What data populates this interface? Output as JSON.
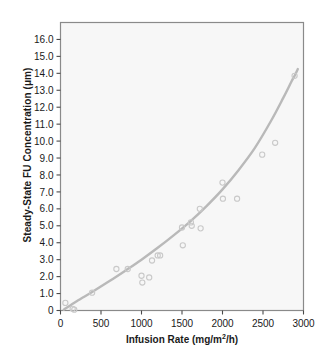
{
  "chart_data": {
    "type": "scatter",
    "title": "",
    "xlabel": "Infusion Rate (mg/m2/h)",
    "xlabel_parts": {
      "text_before": "Infusion Rate (mg/m",
      "superscript": "2",
      "text_after": "/h)"
    },
    "ylabel": "Steady-State FU Concentration (μm)",
    "xlim": [
      0,
      3000
    ],
    "ylim": [
      0,
      17
    ],
    "xticks": [
      0,
      500,
      1000,
      1500,
      2000,
      2500,
      3000
    ],
    "xtick_labels": [
      "0",
      "500",
      "1000",
      "1500",
      "2000",
      "2500",
      "3000"
    ],
    "yticks": [
      0,
      1,
      2,
      3,
      4,
      5,
      6,
      7,
      8,
      9,
      10,
      11,
      12,
      13,
      14,
      15,
      16
    ],
    "ytick_labels": [
      "0",
      "1.0",
      "2.0",
      "3.0",
      "4.0",
      "5.0",
      "6.0",
      "7.0",
      "8.0",
      "9.0",
      "10.0",
      "11.0",
      "12.0",
      "13.0",
      "14.0",
      "15.0",
      "16.0"
    ],
    "grid": false,
    "legend": null,
    "marker": "open-circle",
    "points": [
      {
        "x": 60,
        "y": 0.45
      },
      {
        "x": 150,
        "y": 0.1
      },
      {
        "x": 170,
        "y": 0.05
      },
      {
        "x": 390,
        "y": 1.05
      },
      {
        "x": 690,
        "y": 2.45
      },
      {
        "x": 830,
        "y": 2.45
      },
      {
        "x": 1000,
        "y": 2.05
      },
      {
        "x": 1010,
        "y": 1.65
      },
      {
        "x": 1095,
        "y": 1.95
      },
      {
        "x": 1130,
        "y": 2.95
      },
      {
        "x": 1200,
        "y": 3.25
      },
      {
        "x": 1230,
        "y": 3.25
      },
      {
        "x": 1500,
        "y": 4.9
      },
      {
        "x": 1510,
        "y": 3.85
      },
      {
        "x": 1610,
        "y": 5.2
      },
      {
        "x": 1620,
        "y": 5.0
      },
      {
        "x": 1720,
        "y": 6.0
      },
      {
        "x": 1730,
        "y": 4.85
      },
      {
        "x": 2000,
        "y": 7.55
      },
      {
        "x": 2005,
        "y": 6.6
      },
      {
        "x": 2180,
        "y": 6.6
      },
      {
        "x": 2490,
        "y": 9.2
      },
      {
        "x": 2650,
        "y": 9.9
      },
      {
        "x": 2890,
        "y": 13.85
      }
    ],
    "fit_curve": {
      "name": "fitted-curve",
      "x": [
        40,
        200,
        400,
        600,
        800,
        1000,
        1200,
        1400,
        1600,
        1800,
        2000,
        2200,
        2400,
        2600,
        2750,
        2850,
        2900,
        2930
      ],
      "y": [
        0.05,
        0.55,
        1.12,
        1.72,
        2.35,
        3.0,
        3.7,
        4.45,
        5.25,
        6.15,
        7.15,
        8.3,
        9.6,
        11.2,
        12.55,
        13.5,
        13.95,
        14.25
      ]
    },
    "colors": {
      "curve": "#b9b9b9",
      "marker_stroke": "#c9c9c9",
      "plot_background": "#f7f7f7",
      "frame": "#8a8a8a",
      "text": "#1a1a1a",
      "tick": "#4a4a4a"
    }
  }
}
